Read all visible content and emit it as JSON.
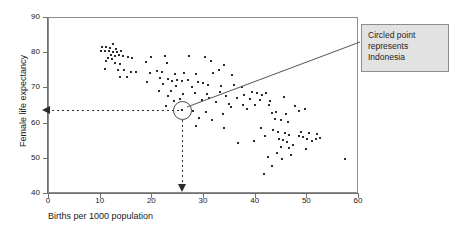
{
  "chart_data": {
    "type": "scatter",
    "title": "",
    "xlabel": "Births per 1000 population",
    "ylabel": "Female life expectancy",
    "xlim": [
      0,
      60
    ],
    "ylim": [
      40,
      90
    ],
    "xticks": [
      0,
      10,
      20,
      30,
      40,
      50,
      60
    ],
    "yticks": [
      40,
      50,
      60,
      70,
      80,
      90
    ],
    "grid": false,
    "legend": null,
    "annotations": [
      {
        "name": "callout",
        "text": "Circled point represents Indonesia",
        "lines": [
          "Circled point",
          "represents",
          "Indonesia"
        ],
        "points_to": {
          "x": 26,
          "y": 63.5
        }
      },
      {
        "name": "horizontal-guide",
        "from": {
          "x": 26,
          "y": 63.5
        },
        "to": {
          "x": 0,
          "y": 63.5
        },
        "style": "dashed-arrow"
      },
      {
        "name": "vertical-guide",
        "from": {
          "x": 26,
          "y": 63.5
        },
        "to": {
          "x": 26,
          "y": 40
        },
        "style": "dashed-arrow"
      }
    ],
    "highlight": {
      "label": "Indonesia",
      "x": 26,
      "y": 63.5,
      "marker": "circle-outline"
    },
    "points": [
      [
        10.4,
        81.5
      ],
      [
        11.2,
        81.6
      ],
      [
        12.0,
        81.3
      ],
      [
        12.6,
        82.2
      ],
      [
        13.1,
        81.0
      ],
      [
        10.3,
        80.4
      ],
      [
        11.0,
        80.2
      ],
      [
        11.8,
        80.3
      ],
      [
        12.5,
        80.0
      ],
      [
        13.4,
        80.1
      ],
      [
        14.2,
        80.2
      ],
      [
        12.1,
        79.2
      ],
      [
        12.9,
        79.0
      ],
      [
        13.8,
        79.1
      ],
      [
        14.6,
        78.9
      ],
      [
        11.6,
        78.4
      ],
      [
        12.4,
        78.2
      ],
      [
        15.4,
        78.6
      ],
      [
        16.2,
        78.3
      ],
      [
        20.0,
        78.5
      ],
      [
        22.6,
        78.8
      ],
      [
        27.3,
        78.9
      ],
      [
        11.3,
        77.4
      ],
      [
        13.0,
        77.0
      ],
      [
        14.0,
        76.7
      ],
      [
        18.9,
        77.2
      ],
      [
        23.0,
        76.8
      ],
      [
        30.4,
        78.6
      ],
      [
        31.5,
        77.4
      ],
      [
        11.1,
        75.1
      ],
      [
        13.5,
        75.0
      ],
      [
        14.8,
        74.9
      ],
      [
        16.0,
        74.4
      ],
      [
        17.0,
        74.3
      ],
      [
        19.8,
        74.2
      ],
      [
        21.0,
        74.6
      ],
      [
        22.0,
        74.5
      ],
      [
        24.6,
        73.9
      ],
      [
        26.4,
        74.0
      ],
      [
        28.7,
        73.9
      ],
      [
        32.0,
        74.0
      ],
      [
        33.0,
        75.0
      ],
      [
        34.0,
        76.5
      ],
      [
        35.7,
        73.6
      ],
      [
        13.9,
        73.0
      ],
      [
        15.3,
        72.9
      ],
      [
        21.6,
        72.6
      ],
      [
        23.3,
        72.5
      ],
      [
        24.0,
        71.9
      ],
      [
        25.0,
        72.0
      ],
      [
        26.0,
        71.8
      ],
      [
        27.0,
        72.2
      ],
      [
        29.0,
        71.5
      ],
      [
        30.0,
        71.2
      ],
      [
        31.0,
        70.8
      ],
      [
        33.5,
        70.5
      ],
      [
        36.0,
        70.8
      ],
      [
        37.5,
        70.2
      ],
      [
        22.2,
        70.9
      ],
      [
        24.8,
        70.4
      ],
      [
        27.8,
        70.1
      ],
      [
        21.5,
        69.0
      ],
      [
        23.8,
        68.9
      ],
      [
        26.2,
        68.2
      ],
      [
        28.4,
        68.5
      ],
      [
        30.8,
        68.1
      ],
      [
        34.5,
        67.5
      ],
      [
        38.0,
        67.9
      ],
      [
        39.5,
        68.6
      ],
      [
        40.4,
        68.3
      ],
      [
        41.5,
        67.8
      ],
      [
        42.2,
        68.4
      ],
      [
        36.6,
        66.9
      ],
      [
        39.0,
        66.6
      ],
      [
        41.0,
        66.4
      ],
      [
        43.0,
        66.2
      ],
      [
        23.2,
        67.5
      ],
      [
        25.6,
        66.8
      ],
      [
        29.8,
        66.3
      ],
      [
        32.6,
        65.9
      ],
      [
        35.0,
        65.4
      ],
      [
        37.8,
        65.1
      ],
      [
        40.0,
        65.0
      ],
      [
        42.8,
        64.9
      ],
      [
        45.6,
        67.2
      ],
      [
        26.0,
        63.5
      ],
      [
        28.0,
        63.2
      ],
      [
        30.5,
        62.9
      ],
      [
        33.8,
        62.5
      ],
      [
        43.3,
        62.8
      ],
      [
        44.2,
        63.0
      ],
      [
        46.0,
        62.4
      ],
      [
        44.0,
        61.0
      ],
      [
        45.0,
        60.6
      ],
      [
        46.4,
        60.2
      ],
      [
        29.2,
        61.4
      ],
      [
        31.8,
        60.8
      ],
      [
        28.6,
        58.9
      ],
      [
        34.0,
        58.4
      ],
      [
        41.2,
        58.6
      ],
      [
        43.5,
        57.8
      ],
      [
        44.6,
        57.4
      ],
      [
        45.8,
        57.0
      ],
      [
        46.6,
        56.6
      ],
      [
        42.0,
        56.2
      ],
      [
        44.8,
        55.4
      ],
      [
        45.4,
        55.0
      ],
      [
        46.2,
        54.6
      ],
      [
        48.5,
        56.3
      ],
      [
        49.4,
        55.8
      ],
      [
        50.2,
        55.4
      ],
      [
        51.0,
        54.9
      ],
      [
        51.8,
        55.2
      ],
      [
        39.8,
        54.8
      ],
      [
        49.0,
        57.4
      ],
      [
        50.6,
        57.0
      ],
      [
        52.0,
        56.8
      ],
      [
        52.6,
        55.6
      ],
      [
        36.8,
        54.2
      ],
      [
        45.0,
        53.2
      ],
      [
        46.6,
        52.8
      ],
      [
        47.4,
        53.6
      ],
      [
        50.0,
        52.6
      ],
      [
        44.4,
        51.5
      ],
      [
        47.0,
        50.9
      ],
      [
        42.6,
        50.2
      ],
      [
        45.2,
        49.6
      ],
      [
        57.4,
        49.8
      ],
      [
        43.4,
        47.6
      ],
      [
        41.8,
        45.4
      ],
      [
        24.4,
        66.0
      ],
      [
        22.8,
        64.8
      ],
      [
        38.6,
        63.8
      ],
      [
        35.4,
        64.4
      ],
      [
        47.8,
        64.6
      ],
      [
        48.6,
        63.4
      ],
      [
        49.8,
        63.8
      ],
      [
        33.2,
        68.8
      ],
      [
        31.2,
        67.0
      ],
      [
        19.2,
        71.4
      ]
    ]
  }
}
